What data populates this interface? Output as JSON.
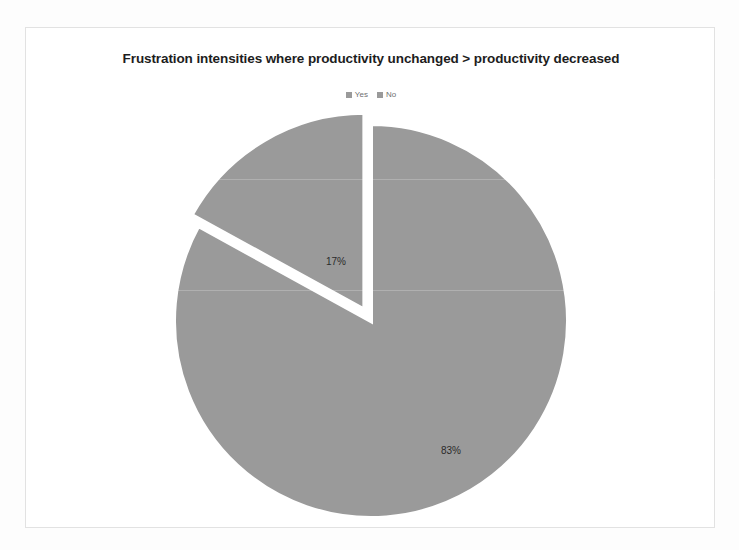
{
  "chart_data": {
    "type": "pie",
    "title": "Frustration intensities where productivity unchanged > productivity decreased",
    "subtitle": "",
    "categories": [
      "Yes",
      "No"
    ],
    "values": [
      83,
      17
    ],
    "value_labels": [
      "83%",
      "17%"
    ],
    "units": "percent",
    "legend": {
      "position": "top",
      "entries": [
        {
          "label": "Yes",
          "color": "#9a9a9a"
        },
        {
          "label": "No",
          "color": "#9a9a9a"
        }
      ]
    },
    "slices": [
      {
        "name": "Yes",
        "label": "83%",
        "value": 83,
        "color": "#9a9a9a",
        "exploded": false,
        "start_angle_deg": 0,
        "end_angle_deg": 298.8
      },
      {
        "name": "No",
        "label": "17%",
        "value": 17,
        "color": "#9a9a9a",
        "exploded": true,
        "start_angle_deg": 298.8,
        "end_angle_deg": 360
      }
    ],
    "grid": false,
    "xlabel": "",
    "ylabel": ""
  },
  "chart": {
    "title": "Frustration intensities where productivity unchanged > productivity decreased",
    "legend_yes": "Yes",
    "legend_no": "No",
    "label_large": "83%",
    "label_small": "17%"
  },
  "colors": {
    "slice_fill": "#9a9a9a",
    "slice_border": "#ffffff",
    "frame_border": "#e2e2e2",
    "title_text": "#1d1d1d",
    "legend_text": "#6f6f6f",
    "label_text": "#2a2a2a",
    "background": "#ffffff"
  }
}
